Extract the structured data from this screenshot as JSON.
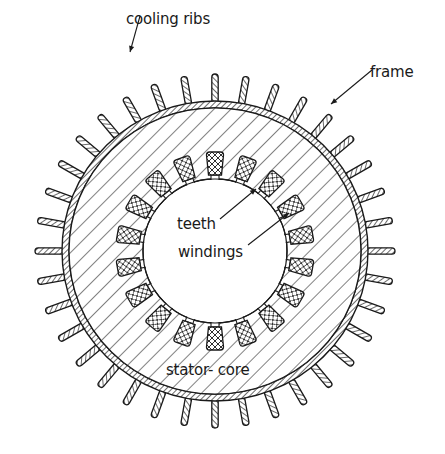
{
  "diagram": {
    "title": "",
    "geometry": {
      "center": [
        215,
        251
      ],
      "frame_outer_rx": 153,
      "frame_outer_ry": 150,
      "frame_thickness": 7,
      "rib_count": 36,
      "rib_length": 27,
      "rib_start_angle_deg": -90,
      "bore_radius": 72,
      "slot_count": 18,
      "winding_inner_r": 76,
      "winding_outer_r": 99,
      "slot_start_angle_deg": -90
    },
    "colors": {
      "ink": "#1a1a1a",
      "background": "#ffffff"
    },
    "labels": [
      {
        "id": "cooling-ribs",
        "text": "cooling ribs",
        "x": 126,
        "y": 12
      },
      {
        "id": "frame",
        "text": "frame",
        "x": 370,
        "y": 65
      },
      {
        "id": "teeth",
        "text": "teeth",
        "x": 177,
        "y": 217
      },
      {
        "id": "windings",
        "text": "windings",
        "x": 178,
        "y": 245
      },
      {
        "id": "stator-core",
        "text": "stator- core",
        "x": 166,
        "y": 363
      }
    ],
    "leaders": [
      {
        "id": "cooling-ribs-leader",
        "from": [
          140,
          16
        ],
        "to": [
          130,
          52
        ]
      },
      {
        "id": "frame-leader",
        "from": [
          372,
          70
        ],
        "to": [
          331,
          104
        ]
      },
      {
        "id": "teeth-leader",
        "from": [
          220,
          219
        ],
        "to": [
          256,
          189
        ]
      },
      {
        "id": "windings-leader",
        "from": [
          248,
          245
        ],
        "to": [
          289,
          213
        ]
      }
    ]
  }
}
